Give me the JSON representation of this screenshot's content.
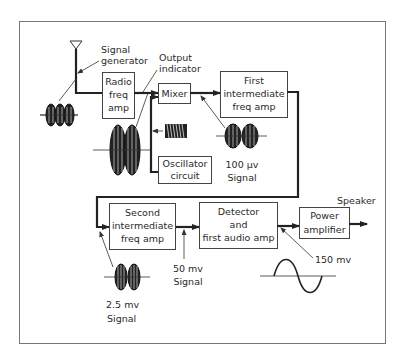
{
  "diagram": {
    "colors": {
      "line": "#222222",
      "box_border": "#444444",
      "text": "#2a2a2a",
      "background": "#ffffff"
    },
    "annotations": {
      "signal_generator_line1": "Signal",
      "signal_generator_line2": "generator",
      "output_indicator_line1": "Output",
      "output_indicator_line2": "indicator",
      "speaker": "Speaker"
    },
    "blocks": {
      "radio_freq_amp": [
        "Radio",
        "freq",
        "amp"
      ],
      "mixer": [
        "Mixer"
      ],
      "first_if_amp": [
        "First",
        "intermediate",
        "freq amp"
      ],
      "oscillator": [
        "Oscillator",
        "circuit"
      ],
      "second_if_amp": [
        "Second",
        "intermediate",
        "freq amp"
      ],
      "detector": [
        "Detector",
        "and",
        "first audio amp"
      ],
      "power_amp": [
        "Power",
        "amplifier"
      ]
    },
    "signals": {
      "if_100uv": [
        "100 µv",
        "Signal"
      ],
      "if_2_5mv": [
        "2.5 mv",
        "Signal"
      ],
      "if_50mv": [
        "50 mv",
        "Signal"
      ],
      "audio_150mv": [
        "150 mv"
      ]
    },
    "icons": [
      "antenna-icon",
      "rf-waveform-icon",
      "modulated-waveform-icon",
      "oscillator-waveform-icon",
      "sine-wave-icon",
      "arrow-icon"
    ]
  }
}
